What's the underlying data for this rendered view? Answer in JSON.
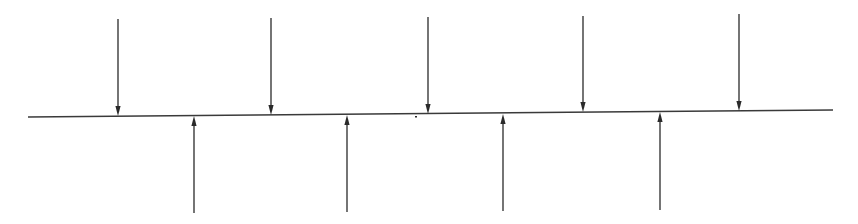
{
  "diagram": {
    "colors": {
      "background": "#ffffff",
      "line": "#3a3a3a",
      "arrow": "#2a2a2a"
    },
    "beam": {
      "x1": 28,
      "y1": 117,
      "x2": 833,
      "y2": 110
    },
    "down_arrows": [
      {
        "x": 118,
        "y_start": 19,
        "y_end": 116
      },
      {
        "x": 271,
        "y_start": 18,
        "y_end": 115
      },
      {
        "x": 428,
        "y_start": 17,
        "y_end": 114
      },
      {
        "x": 583,
        "y_start": 16,
        "y_end": 112
      },
      {
        "x": 739,
        "y_start": 14,
        "y_end": 111
      }
    ],
    "up_arrows": [
      {
        "x": 194,
        "y_start": 213,
        "y_end": 116
      },
      {
        "x": 347,
        "y_start": 212,
        "y_end": 115
      },
      {
        "x": 503,
        "y_start": 211,
        "y_end": 114
      },
      {
        "x": 660,
        "y_start": 210,
        "y_end": 112
      }
    ],
    "marks": [
      {
        "x": 416,
        "y": 116
      }
    ]
  }
}
